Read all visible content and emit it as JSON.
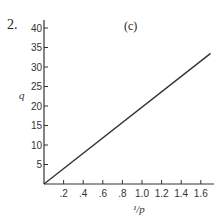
{
  "problem_number": "2.",
  "panel_label": "(c)",
  "chart_data": {
    "type": "line",
    "title": "(c)",
    "xlabel": "1/p",
    "ylabel": "q",
    "x_ticks": [
      ".2",
      ".4",
      ".6",
      ".8",
      "1.0",
      "1.2",
      "1.4",
      "1.6"
    ],
    "y_ticks": [
      "5",
      "10",
      "15",
      "20",
      "25",
      "30",
      "35",
      "40"
    ],
    "xlim": [
      0,
      1.7
    ],
    "ylim": [
      0,
      42
    ],
    "grid": false,
    "series": [
      {
        "name": "q vs 1/p",
        "x": [
          0,
          1.7
        ],
        "y": [
          0,
          33.5
        ]
      }
    ]
  },
  "axes": {
    "x_label_display": "¹/p",
    "y_label_display": "q"
  }
}
